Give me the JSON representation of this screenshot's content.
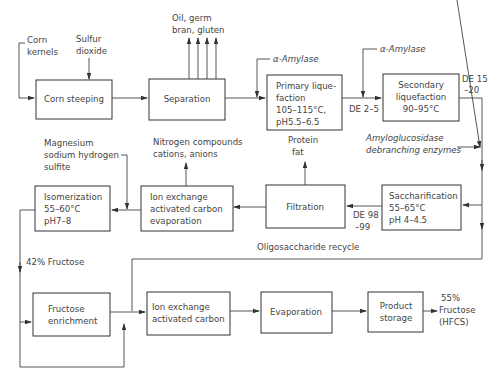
{
  "diagram": {
    "inputs": {
      "corn_kernels": [
        "Corn",
        "kernels"
      ],
      "sulfur_dioxide": [
        "Sulfur",
        "dioxide"
      ],
      "alpha_amylase_1": "α-Amylase",
      "alpha_amylase_2": "α-Amylase",
      "amyloglucosidase": [
        "Amyloglucosidase",
        "debranching enzymes"
      ],
      "magnesium_sulfite": [
        "Magnesium",
        "sodium hydrogen",
        "sulfite"
      ]
    },
    "outputs": {
      "separation_byproducts": [
        "Oil, germ",
        "bran, gluten"
      ],
      "filtration_byproducts": [
        "Protein",
        "fat"
      ],
      "ion_exchange_byproducts": [
        "Nitrogen compounds",
        "cations, anions"
      ],
      "final_product": [
        "55%",
        "Fructose",
        "(HFCS)"
      ]
    },
    "boxes": {
      "corn_steeping": [
        "Corn steeping"
      ],
      "separation": [
        "Separation"
      ],
      "primary_liquefaction": [
        "Primary lique-",
        "faction",
        "105–115°C,",
        "pH5.5–6.5"
      ],
      "secondary_liquefaction": [
        "Secondary",
        "liquefaction",
        "90–95°C"
      ],
      "saccharification": [
        "Saccharification",
        "55–65°C",
        "pH 4–4.5"
      ],
      "filtration": [
        "Filtration"
      ],
      "ion_exchange_1": [
        "Ion exchange",
        "activated carbon",
        "evaporation"
      ],
      "isomerization": [
        "Isomerization",
        "55–60°C",
        "pH7–8"
      ],
      "fructose_enrichment": [
        "Fructose",
        "enrichment"
      ],
      "ion_exchange_2": [
        "Ion exchange",
        "activated carbon"
      ],
      "evaporation": [
        "Evaporation"
      ],
      "product_storage": [
        "Product",
        "storage"
      ]
    },
    "flow_labels": {
      "de_2_5": "DE 2–5",
      "de_15_20": [
        "DE 15",
        "–20"
      ],
      "de_98_99": [
        "DE 98",
        "–99"
      ],
      "oligosaccharide_recycle": "Oligosaccharide recycle",
      "fructose_42": "42% Fructose"
    }
  }
}
